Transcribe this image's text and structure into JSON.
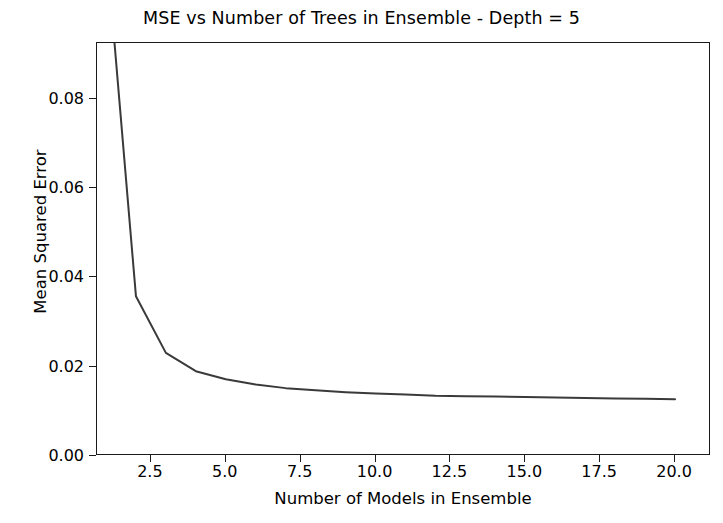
{
  "chart_data": {
    "type": "line",
    "title": "MSE vs Number of Trees in Ensemble - Depth = 5",
    "xlabel": "Number of Models in Ensemble",
    "ylabel": "Mean Squared Error",
    "xlim": [
      0.7,
      21.2
    ],
    "ylim": [
      0.0,
      0.0925
    ],
    "grid": false,
    "legend": null,
    "xticks": [
      2.5,
      5.0,
      7.5,
      10.0,
      12.5,
      15.0,
      17.5,
      20.0
    ],
    "xtick_labels": [
      "2.5",
      "5.0",
      "7.5",
      "10.0",
      "12.5",
      "15.0",
      "17.5",
      "20.0"
    ],
    "yticks": [
      0.0,
      0.02,
      0.04,
      0.06,
      0.08
    ],
    "ytick_labels": [
      "0.00",
      "0.02",
      "0.04",
      "0.06",
      "0.08"
    ],
    "line_color": "#3a3a3a",
    "line_width": 2.0,
    "series": [
      {
        "name": "Mean Squared Error",
        "x": [
          1,
          2,
          3,
          4,
          5,
          6,
          7,
          8,
          9,
          10,
          11,
          12,
          13,
          14,
          15,
          16,
          17,
          18,
          19,
          20
        ],
        "values": [
          0.115,
          0.0358,
          0.0231,
          0.019,
          0.0172,
          0.016,
          0.0152,
          0.0147,
          0.0143,
          0.014,
          0.0138,
          0.0135,
          0.0134,
          0.0133,
          0.0132,
          0.0131,
          0.013,
          0.0129,
          0.0128,
          0.0127
        ]
      }
    ]
  },
  "figure": {
    "background": "#ffffff",
    "axis_color": "#1a1a1a",
    "text_color": "#000000"
  }
}
